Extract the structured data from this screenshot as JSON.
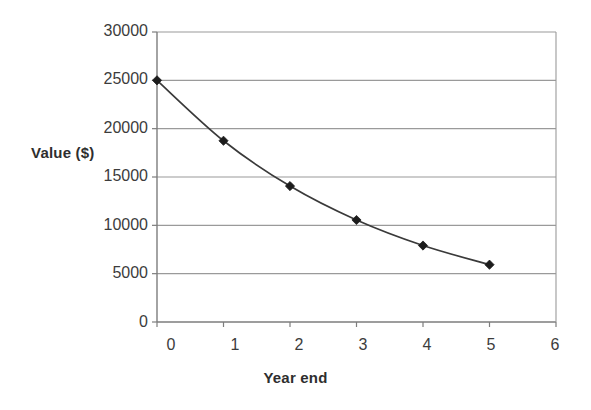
{
  "chart_data": {
    "type": "line",
    "title": "",
    "xlabel": "Year end",
    "ylabel": "Value ($)",
    "x": [
      0,
      1,
      2,
      3,
      4,
      5
    ],
    "values": [
      25000,
      18750,
      14060,
      10550,
      7910,
      5930
    ],
    "series": [
      {
        "name": "Value",
        "values": [
          25000,
          18750,
          14060,
          10550,
          7910,
          5930
        ]
      }
    ],
    "xlim": [
      0,
      6
    ],
    "ylim": [
      0,
      30000
    ],
    "xticks": [
      "0",
      "1",
      "2",
      "3",
      "4",
      "5",
      "6"
    ],
    "yticks": [
      "0",
      "5000",
      "10000",
      "15000",
      "20000",
      "25000",
      "30000"
    ],
    "grid": "horizontal",
    "legend": "none",
    "marker": "diamond",
    "line_color": "#3a3a3a",
    "marker_color": "#1c1c1c",
    "grid_color": "#9a9a9a",
    "axis_color": "#7d7d7d",
    "background": "#ffffff"
  }
}
